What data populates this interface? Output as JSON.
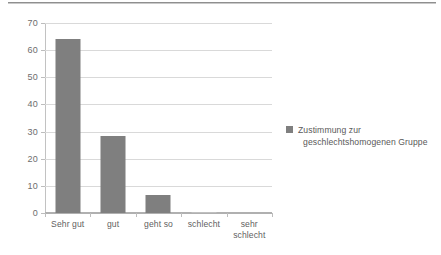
{
  "chart_data": {
    "type": "bar",
    "title": "",
    "subtitle": "",
    "xlabel": "",
    "ylabel": "",
    "categories": [
      "Sehr gut",
      "gut",
      "geht so",
      "schlecht",
      "sehr schlecht"
    ],
    "category_lines": [
      [
        "Sehr gut"
      ],
      [
        "gut"
      ],
      [
        "geht so"
      ],
      [
        "schlecht"
      ],
      [
        "sehr",
        "schlecht"
      ]
    ],
    "series": [
      {
        "name": "Zustimmung zur geschlechtshomogenen Gruppe",
        "color": "#7f7f7f",
        "values": [
          64,
          28.5,
          6.5,
          0.5,
          0
        ]
      }
    ],
    "ylim": [
      0,
      70
    ],
    "ytick_step": 10,
    "yticks": [
      0,
      10,
      20,
      30,
      40,
      50,
      60,
      70
    ],
    "ytick_labels": [
      "0",
      "10",
      "20",
      "30",
      "40",
      "50",
      "60",
      "70"
    ],
    "grid": true,
    "grid_axis": "y",
    "legend_position": "right",
    "bar_color": "#7f7f7f",
    "grid_color": "#d9d9d9",
    "axis_color": "#b0b0b0"
  },
  "legend": {
    "entries": [
      {
        "swatch_name": "legend-swatch-zustimmung",
        "line1": "Zustimmung zur",
        "line2": "geschlechtshomogenen Gruppe",
        "color": "#7f7f7f"
      }
    ]
  }
}
